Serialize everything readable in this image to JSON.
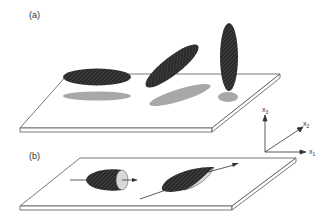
{
  "panels": {
    "a": {
      "label": "(a)"
    },
    "b": {
      "label": "(b)"
    }
  },
  "axes": {
    "x1": "x",
    "x1_sub": "1",
    "x2": "x",
    "x2_sub": "2",
    "x3": "x",
    "x3_sub": "3"
  },
  "colors": {
    "particle": "#2b2b2b",
    "shadow": "#a8a8a8",
    "plate_stroke": "#555555",
    "cut_face": "#d8d8d8"
  }
}
